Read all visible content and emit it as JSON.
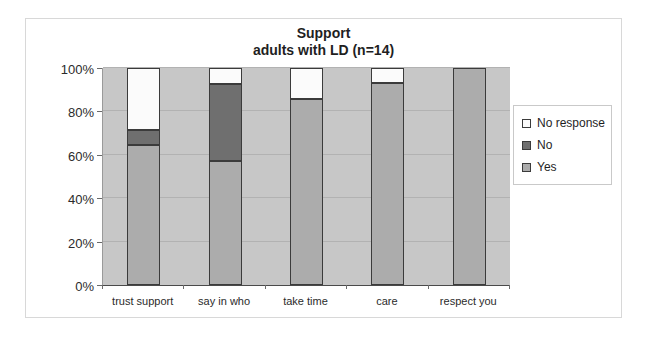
{
  "title": {
    "line1": "Support",
    "line2": "adults with LD (n=14)"
  },
  "colors": {
    "yes": "#ACACAC",
    "no": "#6F6F6F",
    "no_response": "#FBFBFB",
    "plot_bg": "#C7C7C7",
    "gridline": "#B2B2B2",
    "axis": "#4A4A4A",
    "bar_border": "#3B3B3B",
    "frame_border": "#D8D8D8",
    "text": "#2B2B2B"
  },
  "chart_data": {
    "type": "bar",
    "stacked": true,
    "title": "Support adults with LD (n=14)",
    "categories": [
      "trust support",
      "say in who",
      "take time",
      "care",
      "respect you"
    ],
    "series": [
      {
        "name": "Yes",
        "color_key": "yes",
        "values": [
          64.3,
          57.1,
          85.7,
          92.9,
          100
        ]
      },
      {
        "name": "No",
        "color_key": "no",
        "values": [
          7.1,
          35.7,
          0,
          0,
          0
        ]
      },
      {
        "name": "No response",
        "color_key": "no_response",
        "values": [
          28.6,
          7.1,
          14.3,
          7.1,
          0
        ]
      }
    ],
    "y_tick_values": [
      0,
      20,
      40,
      60,
      80,
      100
    ],
    "y_tick_labels": [
      "0%",
      "20%",
      "40%",
      "60%",
      "80%",
      "100%"
    ],
    "ylim": [
      0,
      100
    ],
    "xlabel": "",
    "ylabel": "",
    "grid": true,
    "legend_position": "right",
    "legend_order": [
      "No response",
      "No",
      "Yes"
    ]
  }
}
